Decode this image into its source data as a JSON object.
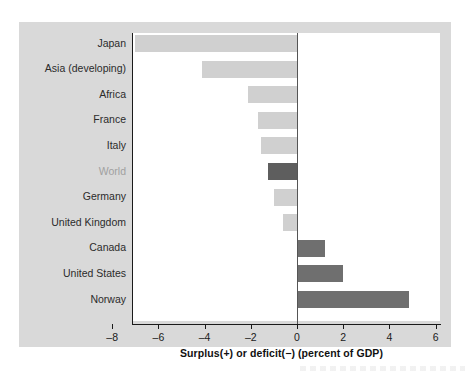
{
  "chart_data": {
    "type": "bar",
    "orientation": "horizontal",
    "title": "",
    "xlabel": "Surplus(+) or deficit(−) (percent of GDP)",
    "ylabel": "",
    "xlim": [
      -8,
      6
    ],
    "xticks": [
      -8,
      -6,
      -4,
      -2,
      0,
      2,
      4,
      6
    ],
    "xtick_labels": [
      "–8",
      "–6",
      "–4",
      "–2",
      "0",
      "2",
      "4",
      "6"
    ],
    "grid": false,
    "legend": "none",
    "zero_reference_line": true,
    "categories": [
      "Japan",
      "Asia (developing)",
      "Africa",
      "France",
      "Italy",
      "World",
      "Germany",
      "United Kingdom",
      "Canada",
      "United States",
      "Norway"
    ],
    "values": [
      -7.0,
      -4.1,
      -2.1,
      -1.7,
      -1.55,
      -1.25,
      -1.0,
      -0.6,
      1.2,
      2.0,
      4.85
    ],
    "bar_colors": [
      "#d0d0d0",
      "#d0d0d0",
      "#d0d0d0",
      "#d0d0d0",
      "#d0d0d0",
      "#5e5e5e",
      "#d0d0d0",
      "#d0d0d0",
      "#6f6f6f",
      "#6f6f6f",
      "#6f6f6f"
    ],
    "highlight_category": "World",
    "bars": [
      {
        "label": "Japan",
        "value": -7.0,
        "color": "#d0d0d0",
        "highlight": false
      },
      {
        "label": "Asia (developing)",
        "value": -4.1,
        "color": "#d0d0d0",
        "highlight": false
      },
      {
        "label": "Africa",
        "value": -2.1,
        "color": "#d0d0d0",
        "highlight": false
      },
      {
        "label": "France",
        "value": -1.7,
        "color": "#d0d0d0",
        "highlight": false
      },
      {
        "label": "Italy",
        "value": -1.55,
        "color": "#d0d0d0",
        "highlight": false
      },
      {
        "label": "World",
        "value": -1.25,
        "color": "#5e5e5e",
        "highlight": true
      },
      {
        "label": "Germany",
        "value": -1.0,
        "color": "#d0d0d0",
        "highlight": false
      },
      {
        "label": "United Kingdom",
        "value": -0.6,
        "color": "#d0d0d0",
        "highlight": false
      },
      {
        "label": "Canada",
        "value": 1.2,
        "color": "#6f6f6f",
        "highlight": false
      },
      {
        "label": "United States",
        "value": 2.0,
        "color": "#6f6f6f",
        "highlight": false
      },
      {
        "label": "Norway",
        "value": 4.85,
        "color": "#6f6f6f",
        "highlight": false
      }
    ]
  },
  "style": {
    "panel_background": "#d9d9d9",
    "plot_background": "#ffffff",
    "axis_color": "#1a1a1a",
    "label_color": "#2b2b2b",
    "highlight_label_color": "#a0a0a0",
    "bar_light": "#d0d0d0",
    "bar_dark": "#6f6f6f",
    "bar_highlight": "#5e5e5e"
  }
}
